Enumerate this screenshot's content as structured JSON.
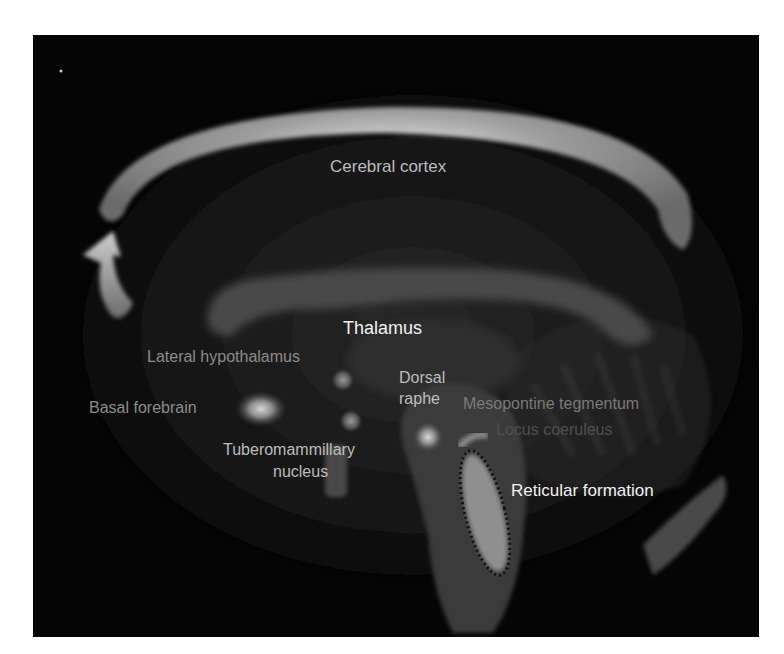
{
  "diagram": {
    "labels": {
      "cerebral_cortex": "Cerebral cortex",
      "thalamus": "Thalamus",
      "lateral_hypothalamus": "Lateral hypothalamus",
      "basal_forebrain": "Basal forebrain",
      "dorsal_raphe_line1": "Dorsal",
      "dorsal_raphe_line2": "raphe",
      "mesopontine_tegmentum": "Mesopontine tegmentum",
      "locus_coeruleus": "Locus coeruleus",
      "tuberomammillary_line1": "Tuberomammillary",
      "tuberomammillary_line2": "nucleus",
      "reticular_formation": "Reticular formation"
    },
    "colors": {
      "background": "#050505",
      "page": "#ffffff",
      "white_label": "#f2f2f2",
      "gray_label": "#8c8c8c",
      "dim_label": "#5a5a5a",
      "cortex_band": "#9a9a9a",
      "dotted_outline": "#111111"
    }
  }
}
